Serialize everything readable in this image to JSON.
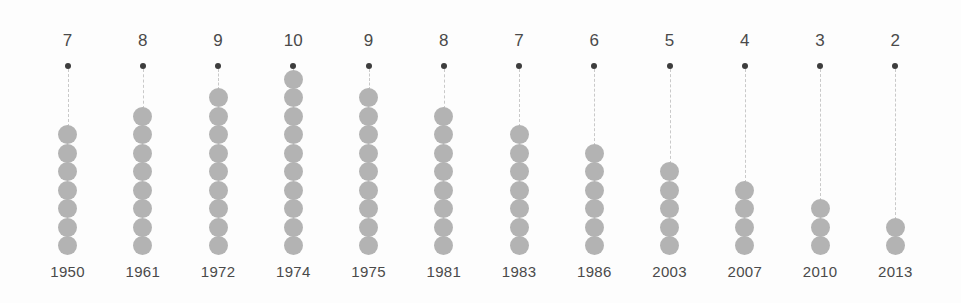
{
  "chart_data": {
    "type": "bar",
    "subtype": "dot-column-unit-chart",
    "title": "",
    "subtitle": "",
    "xlabel": "",
    "ylabel": "",
    "categories": [
      "1950",
      "1961",
      "1972",
      "1974",
      "1975",
      "1981",
      "1983",
      "1986",
      "2003",
      "2007",
      "2010",
      "2013"
    ],
    "values": [
      7,
      8,
      9,
      10,
      9,
      8,
      7,
      6,
      5,
      4,
      3,
      2
    ],
    "value_labels": [
      "7",
      "8",
      "9",
      "10",
      "9",
      "8",
      "7",
      "6",
      "5",
      "4",
      "3",
      "2"
    ],
    "ylim": [
      0,
      10
    ],
    "grid": false,
    "legend": null,
    "annotations": [],
    "series": [
      {
        "name": "count",
        "values": [
          7,
          8,
          9,
          10,
          9,
          8,
          7,
          6,
          5,
          4,
          3,
          2
        ]
      }
    ],
    "unit_marker": "circle",
    "unit_value": 1,
    "columns": [
      {
        "category": "1950",
        "value": 7,
        "value_label": "7",
        "units": 7
      },
      {
        "category": "1961",
        "value": 8,
        "value_label": "8",
        "units": 8
      },
      {
        "category": "1972",
        "value": 9,
        "value_label": "9",
        "units": 9
      },
      {
        "category": "1974",
        "value": 10,
        "value_label": "10",
        "units": 10
      },
      {
        "category": "1975",
        "value": 9,
        "value_label": "9",
        "units": 9
      },
      {
        "category": "1981",
        "value": 8,
        "value_label": "8",
        "units": 8
      },
      {
        "category": "1983",
        "value": 7,
        "value_label": "7",
        "units": 7
      },
      {
        "category": "1986",
        "value": 6,
        "value_label": "6",
        "units": 6
      },
      {
        "category": "2003",
        "value": 5,
        "value_label": "5",
        "units": 5
      },
      {
        "category": "2007",
        "value": 4,
        "value_label": "4",
        "units": 4
      },
      {
        "category": "2010",
        "value": 3,
        "value_label": "3",
        "units": 3
      },
      {
        "category": "2013",
        "value": 2,
        "value_label": "2",
        "units": 2
      }
    ]
  },
  "colors": {
    "background": "#fdfdfd",
    "unit_dot": "#b3b3b3",
    "top_dot": "#3d3d3d",
    "connector_line": "#c9c9c9",
    "text": "#4a4a4a"
  }
}
